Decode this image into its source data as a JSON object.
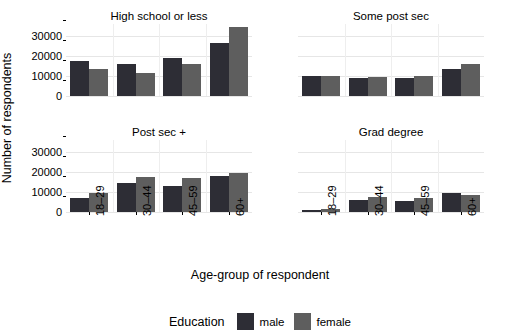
{
  "chart_data": {
    "type": "bar",
    "title": "",
    "xlabel": "Age-group of respondent",
    "ylabel": "Number of respondents",
    "ylim": [
      0,
      36000
    ],
    "yticks": [
      0,
      10000,
      20000,
      30000
    ],
    "ytick_labels": [
      "0",
      "10000",
      "20000",
      "30000"
    ],
    "categories": [
      "18–29",
      "30–44",
      "45–59",
      "60+"
    ],
    "grid": true,
    "legend": {
      "title": "Education",
      "position": "bottom",
      "entries": [
        {
          "name": "male",
          "color": "#2d2d35"
        },
        {
          "name": "female",
          "color": "#5e5e5e"
        }
      ]
    },
    "facet_layout": {
      "rows": 2,
      "cols": 2
    },
    "facets": [
      {
        "label": "High school or less",
        "series": [
          {
            "name": "male",
            "values": [
              17500,
              16000,
              18800,
              26500
            ]
          },
          {
            "name": "female",
            "values": [
              13500,
              11300,
              16200,
              34500
            ]
          }
        ]
      },
      {
        "label": "Some post sec",
        "series": [
          {
            "name": "male",
            "values": [
              9800,
              8900,
              9200,
              13500
            ]
          },
          {
            "name": "female",
            "values": [
              9800,
              9300,
              10200,
              16000
            ]
          }
        ]
      },
      {
        "label": "Post sec +",
        "series": [
          {
            "name": "male",
            "values": [
              7200,
              14500,
              13200,
              17800
            ]
          },
          {
            "name": "female",
            "values": [
              9300,
              17500,
              16800,
              19500
            ]
          }
        ]
      },
      {
        "label": "Grad degree",
        "series": [
          {
            "name": "male",
            "values": [
              900,
              6000,
              5400,
              9600
            ]
          },
          {
            "name": "female",
            "values": [
              1400,
              7400,
              6900,
              8600
            ]
          }
        ]
      }
    ]
  },
  "colors": {
    "male": "#2d2d35",
    "female": "#5e5e5e",
    "background": "#ffffff",
    "gridline": "#eeeeee",
    "text": "#000000"
  }
}
